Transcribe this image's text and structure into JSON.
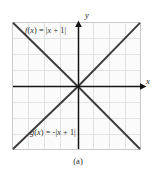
{
  "figure": {
    "caption": "(a)",
    "axis_labels": {
      "x": "x",
      "y": "y"
    },
    "curve_labels": {
      "f": "f(x) = |x + 1|",
      "g": "g(x) = -|x + 1|"
    },
    "colors": {
      "plot_background": "#fbfbfb",
      "grid": "#dedede",
      "plot_border": "#c8c8c8",
      "axis": "#1a1a1a",
      "curve": "#3c3c3c",
      "page_background": "#ffffff",
      "text": "#2b2b2b"
    }
  },
  "chart_data": {
    "type": "line",
    "title": "",
    "xlabel": "x",
    "ylabel": "y",
    "grid": true,
    "legend": "none",
    "xlim": [
      -5,
      4
    ],
    "ylim": [
      -4,
      4
    ],
    "grid_spacing": 1,
    "vertex": {
      "x": -1,
      "y": 0
    },
    "series": [
      {
        "name": "f(x) = |x + 1|",
        "equation": "f(x) = |x + 1|",
        "x": [
          -5,
          -1,
          4
        ],
        "values": [
          4,
          0,
          5
        ],
        "label_position": {
          "x": -4,
          "y": 3.3
        }
      },
      {
        "name": "g(x) = -|x + 1|",
        "equation": "g(x) = -|x + 1|",
        "x": [
          -5,
          -1,
          4
        ],
        "values": [
          -4,
          0,
          -5
        ],
        "label_position": {
          "x": -3.5,
          "y": -3.3
        }
      }
    ]
  }
}
